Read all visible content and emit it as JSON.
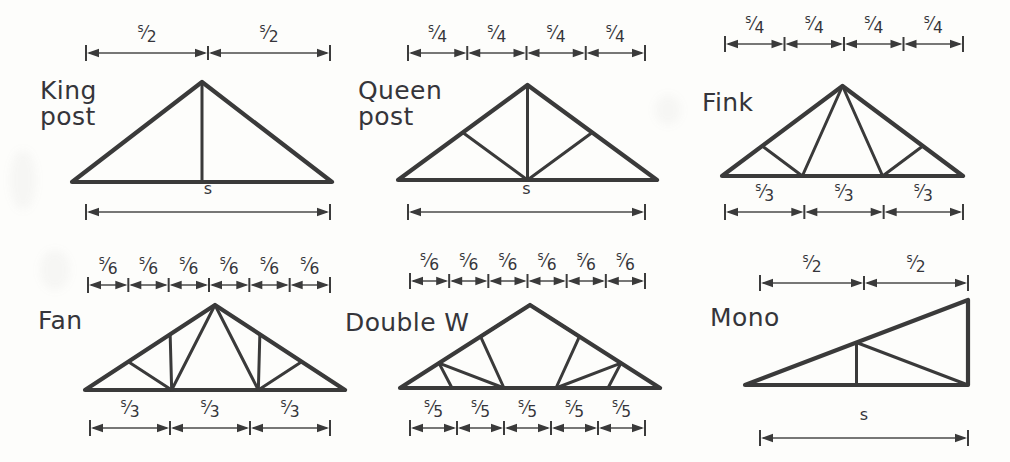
{
  "sheet": {
    "background": "#fdfdfb",
    "ink": "#3a3a3a",
    "title_hidden": "Roof truss types and panel-point spacing"
  },
  "panels": [
    {
      "id": "king-post",
      "label": "King\npost",
      "label_x": 40,
      "label_y": 78,
      "shape": "gable",
      "truss": {
        "x0": 72,
        "x1": 332,
        "baseY": 182,
        "apexY": 82,
        "apexFrac": 0.5
      },
      "webs": "king",
      "top_dim": {
        "y": 53,
        "x0": 86,
        "x1": 330,
        "segments": [
          "s/2",
          "s/2"
        ]
      },
      "bottom_dim": {
        "y": 212,
        "x0": 86,
        "x1": 330,
        "segments": [
          "s"
        ]
      }
    },
    {
      "id": "queen-post",
      "label": "Queen\npost",
      "label_x": 358,
      "label_y": 78,
      "shape": "gable",
      "truss": {
        "x0": 398,
        "x1": 657,
        "baseY": 180,
        "apexY": 85,
        "apexFrac": 0.5
      },
      "top_dim": {
        "y": 53,
        "x0": 408,
        "x1": 645,
        "segments": [
          "s/4",
          "s/4",
          "s/4",
          "s/4"
        ]
      },
      "bottom_dim": {
        "y": 212,
        "x0": 408,
        "x1": 645,
        "segments": [
          "s"
        ]
      },
      "webs": "queen"
    },
    {
      "id": "fink",
      "label": "Fink",
      "label_x": 702,
      "label_y": 90,
      "shape": "gable",
      "truss": {
        "x0": 722,
        "x1": 963,
        "baseY": 176,
        "apexY": 86,
        "apexFrac": 0.5
      },
      "top_dim": {
        "y": 44,
        "x0": 725,
        "x1": 963,
        "segments": [
          "s/4",
          "s/4",
          "s/4",
          "s/4"
        ]
      },
      "bottom_dim": {
        "y": 212,
        "x0": 725,
        "x1": 963,
        "segments": [
          "s/3",
          "s/3",
          "s/3"
        ]
      },
      "webs": "fink"
    },
    {
      "id": "fan",
      "label": "Fan",
      "label_x": 38,
      "label_y": 308,
      "shape": "gable",
      "truss": {
        "x0": 85,
        "x1": 345,
        "baseY": 390,
        "apexY": 305,
        "apexFrac": 0.5
      },
      "top_dim": {
        "y": 285,
        "x0": 88,
        "x1": 330,
        "segments": [
          "s/6",
          "s/6",
          "s/6",
          "s/6",
          "s/6",
          "s/6"
        ]
      },
      "bottom_dim": {
        "y": 428,
        "x0": 90,
        "x1": 330,
        "segments": [
          "s/3",
          "s/3",
          "s/3"
        ]
      },
      "webs": "fan"
    },
    {
      "id": "double-w",
      "label": "Double W",
      "label_x": 345,
      "label_y": 310,
      "shape": "gable",
      "truss": {
        "x0": 400,
        "x1": 660,
        "baseY": 388,
        "apexY": 305,
        "apexFrac": 0.5
      },
      "top_dim": {
        "y": 281,
        "x0": 410,
        "x1": 645,
        "segments": [
          "s/6",
          "s/6",
          "s/6",
          "s/6",
          "s/6",
          "s/6"
        ]
      },
      "bottom_dim": {
        "y": 428,
        "x0": 410,
        "x1": 645,
        "segments": [
          "s/5",
          "s/5",
          "s/5",
          "s/5",
          "s/5"
        ]
      },
      "webs": "doublew"
    },
    {
      "id": "mono",
      "label": "Mono",
      "label_x": 710,
      "label_y": 305,
      "shape": "mono",
      "truss": {
        "x0": 745,
        "x1": 968,
        "baseY": 385,
        "apexY": 300,
        "apexFrac": 1.0
      },
      "top_dim": {
        "y": 283,
        "x0": 760,
        "x1": 968,
        "segments": [
          "s/2",
          "s/2"
        ]
      },
      "bottom_dim": {
        "y": 438,
        "x0": 760,
        "x1": 968,
        "segments": [
          "s"
        ]
      },
      "webs": "mono"
    }
  ],
  "legend": {
    "symbol_s": "s",
    "note": "s = span"
  }
}
